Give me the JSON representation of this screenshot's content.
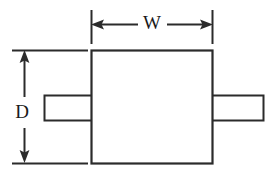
{
  "diagram": {
    "type": "mechanical-dimension-drawing",
    "colors": {
      "background": "#ffffff",
      "line": "#2b2b2b",
      "label": "#1a1a1a",
      "fill": "#ffffff"
    },
    "labels": {
      "width": "W",
      "depth": "D"
    },
    "body": {
      "name": "package-body",
      "x": 91,
      "y": 50,
      "width": 122,
      "height": 113
    },
    "leads": [
      {
        "name": "left-lead",
        "x": 44,
        "y": 95,
        "width": 48,
        "height": 26
      },
      {
        "name": "right-lead",
        "x": 212,
        "y": 95,
        "width": 52,
        "height": 26
      }
    ],
    "dimensions": [
      {
        "name": "width-dimension",
        "label": "W",
        "orientation": "horizontal",
        "line_y": 24,
        "from_x": 91,
        "to_x": 213,
        "label_x": 152,
        "label_y": 31,
        "extension_lines": [
          {
            "x": 91,
            "y1": 10,
            "y2": 44
          },
          {
            "x": 213,
            "y1": 10,
            "y2": 44
          }
        ]
      },
      {
        "name": "depth-dimension",
        "label": "D",
        "orientation": "vertical",
        "line_x": 24,
        "from_y": 50,
        "to_y": 163,
        "label_x": 22,
        "label_y": 114,
        "extension_lines": [
          {
            "y": 50,
            "x1": 12,
            "x2": 88
          },
          {
            "y": 163,
            "x1": 12,
            "x2": 88
          }
        ]
      }
    ]
  }
}
